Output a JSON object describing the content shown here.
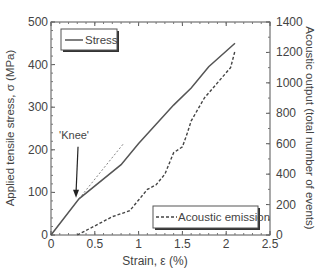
{
  "chart_data": {
    "type": "line",
    "title": "",
    "xlabel": "Strain, ε (%)",
    "ylabel": "Applied tensile stress, σ (MPa)",
    "y2label": "Acoustic output (total number of events)",
    "xlim": [
      0,
      2.5
    ],
    "ylim": [
      0,
      500
    ],
    "y2lim": [
      0,
      1400
    ],
    "xticks": [
      "0",
      "0.5",
      "1",
      "1.5",
      "2",
      "2.5"
    ],
    "yticks": [
      "0",
      "100",
      "200",
      "300",
      "400",
      "500"
    ],
    "y2ticks": [
      "0",
      "200",
      "400",
      "600",
      "800",
      "1000",
      "1200",
      "1400"
    ],
    "grid": false,
    "series": [
      {
        "name": "Stress",
        "axis": "left",
        "style": "solid",
        "x": [
          0,
          0.32,
          0.8,
          1.0,
          1.2,
          1.4,
          1.6,
          1.8,
          2.1
        ],
        "y": [
          0,
          85,
          165,
          215,
          260,
          305,
          345,
          395,
          450
        ]
      },
      {
        "name": "Acoustic emission",
        "axis": "right",
        "style": "dashed",
        "x": [
          0.3,
          0.5,
          0.7,
          0.9,
          1.0,
          1.1,
          1.2,
          1.3,
          1.4,
          1.5,
          1.55,
          1.6,
          1.75,
          1.9,
          2.05,
          2.1
        ],
        "y": [
          0,
          60,
          120,
          160,
          230,
          300,
          330,
          400,
          540,
          580,
          660,
          750,
          900,
          1000,
          1100,
          1210
        ]
      },
      {
        "name": "Linear extrapolation",
        "axis": "left",
        "style": "thin-dashed",
        "x": [
          0.32,
          0.83
        ],
        "y": [
          85,
          215
        ]
      }
    ],
    "annotations": [
      {
        "text": "'Knee'",
        "x": 0.32,
        "y": 85,
        "arrow": true
      }
    ],
    "legends": [
      {
        "label": "Stress",
        "position": "upper left"
      },
      {
        "label": "Acoustic emission",
        "position": "lower right"
      }
    ]
  }
}
